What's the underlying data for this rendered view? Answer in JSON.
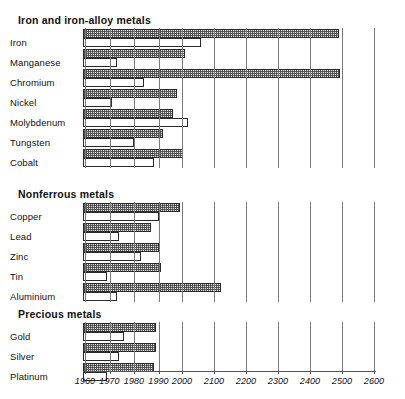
{
  "chart_data": {
    "type": "bar",
    "title": "",
    "xlabel": "",
    "ylabel": "",
    "orientation": "horizontal",
    "grid": true,
    "legend_position": "none",
    "axis_note": "Broken (non-linear) x-axis: decade steps 1960-1990, then century steps 2000-2600",
    "xticks": [
      1960,
      1970,
      1980,
      1990,
      2000,
      2100,
      2200,
      2300,
      2400,
      2500,
      2600
    ],
    "xtick_labels": [
      "1960",
      "1970",
      "1980",
      "1990",
      "2000",
      "2100",
      "2200",
      "2300",
      "2400",
      "2500",
      "2600"
    ],
    "xlim": [
      1960,
      2600
    ],
    "bar_origin": 1960,
    "series": [
      {
        "name": "Shaded bar (upper)",
        "style": "hatched"
      },
      {
        "name": "Open bar (lower)",
        "style": "white"
      }
    ],
    "groups": [
      {
        "title": "Iron and iron-alloy metals",
        "items": [
          {
            "label": "Iron",
            "shaded": 2490,
            "open": 2060
          },
          {
            "label": "Manganese",
            "shaded": 2010,
            "open": 1973
          },
          {
            "label": "Chromium",
            "shaded": 2495,
            "open": 1984
          },
          {
            "label": "Nickel",
            "shaded": 1998,
            "open": 1971
          },
          {
            "label": "Molybdenum",
            "shaded": 1996,
            "open": 2020
          },
          {
            "label": "Tungsten",
            "shaded": 1992,
            "open": 1980
          },
          {
            "label": "Cobalt",
            "shaded": 2003,
            "open": 1988
          }
        ]
      },
      {
        "title": "Nonferrous metals",
        "items": [
          {
            "label": "Copper",
            "shaded": 1999,
            "open": 1990
          },
          {
            "label": "Lead",
            "shaded": 1987,
            "open": 1974
          },
          {
            "label": "Zinc",
            "shaded": 1990,
            "open": 1983
          },
          {
            "label": "Tin",
            "shaded": 1991,
            "open": 1969
          },
          {
            "label": "Aluminium",
            "shaded": 2122,
            "open": 1973
          }
        ]
      },
      {
        "title": "Precious metals",
        "items": [
          {
            "label": "Gold",
            "shaded": 1989,
            "open": 1976
          },
          {
            "label": "Silver",
            "shaded": 1989,
            "open": 1974
          },
          {
            "label": "Platinum",
            "shaded": 1988,
            "open": 1969
          }
        ]
      }
    ]
  },
  "colors": {
    "bar_border": "#2b2b2b",
    "bar_shaded_fill": "#e2e2e2",
    "bar_open_fill": "#ffffff",
    "gridline": "#7a7a7a",
    "text": "#111111"
  }
}
